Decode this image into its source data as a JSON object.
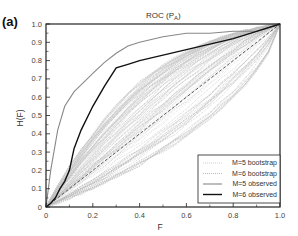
{
  "chart_data": {
    "type": "line",
    "panel_label": "(a)",
    "title_main": "ROC (P",
    "title_sub": "A",
    "title_close": ")",
    "xlabel": "F",
    "ylabel": "H(F)",
    "xlim": [
      0,
      1.0
    ],
    "ylim": [
      0,
      1.0
    ],
    "x_ticks": [
      "0",
      "0.2",
      "0.4",
      "0.6",
      "0.8",
      "1.0"
    ],
    "y_ticks": [
      "0",
      "0.1",
      "0.2",
      "0.3",
      "0.4",
      "0.5",
      "0.6",
      "0.7",
      "0.8",
      "0.9",
      "1.0"
    ],
    "grid": false,
    "legend_position": "lower right",
    "legend": [
      {
        "label": "M=5 bootstrap",
        "style": "dotted",
        "color": "#c8c8c8"
      },
      {
        "label": "M=6 bootstrap",
        "style": "dotted",
        "color": "#b0b0b0"
      },
      {
        "label": "M=5 observed",
        "style": "solid",
        "color": "#888888"
      },
      {
        "label": "M=6 observed",
        "style": "solid",
        "color": "#111111"
      }
    ],
    "series": [
      {
        "name": "M=5 observed",
        "x": [
          0,
          0.02,
          0.05,
          0.08,
          0.12,
          0.16,
          0.2,
          0.25,
          0.3,
          0.35,
          0.4,
          0.5,
          0.6,
          0.7,
          0.8,
          0.9,
          1.0
        ],
        "y": [
          0,
          0.2,
          0.42,
          0.55,
          0.63,
          0.68,
          0.73,
          0.79,
          0.84,
          0.88,
          0.9,
          0.93,
          0.95,
          0.95,
          0.96,
          0.96,
          1.0
        ]
      },
      {
        "name": "M=6 observed",
        "x": [
          0,
          0.02,
          0.04,
          0.06,
          0.08,
          0.1,
          0.12,
          0.15,
          0.2,
          0.25,
          0.3,
          0.35,
          0.4,
          0.5,
          0.6,
          0.7,
          0.8,
          0.9,
          1.0
        ],
        "y": [
          0,
          0.02,
          0.05,
          0.1,
          0.14,
          0.2,
          0.32,
          0.42,
          0.55,
          0.66,
          0.76,
          0.78,
          0.8,
          0.83,
          0.86,
          0.89,
          0.92,
          0.96,
          1.0
        ]
      },
      {
        "name": "chance diagonal",
        "style": "dashed",
        "x": [
          0,
          1.0
        ],
        "y": [
          0,
          1.0
        ]
      }
    ],
    "bootstrap_note": "~100 dotted bootstrap ROC curves per M, spread mostly between H=F and H≈0.75 at F=1 approach, converging at (1,1)"
  }
}
